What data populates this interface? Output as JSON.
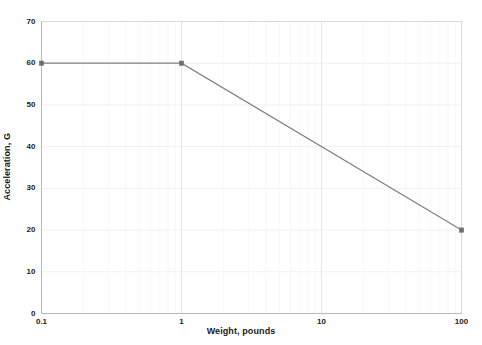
{
  "chart_data": {
    "type": "line",
    "title": "",
    "subtitle": "",
    "xlabel": "Weight, pounds",
    "ylabel": "Acceleration, G",
    "xscale": "log",
    "yscale": "linear",
    "xlim": [
      0.1,
      100
    ],
    "ylim": [
      0,
      70
    ],
    "grid": true,
    "legend": null,
    "xticks": [
      "0.1",
      "1",
      "10",
      "100"
    ],
    "xtick_values": [
      0.1,
      1,
      10,
      100
    ],
    "yticks": [
      "0",
      "10",
      "20",
      "30",
      "40",
      "50",
      "60",
      "70"
    ],
    "ytick_values": [
      0,
      10,
      20,
      30,
      40,
      50,
      60,
      70
    ],
    "series": [
      {
        "name": "Acceleration vs Weight",
        "color": "#808080",
        "marker": "square",
        "marker_color": "#707070",
        "x": [
          0.1,
          1,
          100
        ],
        "y": [
          60,
          60,
          20
        ]
      }
    ],
    "annotations": []
  },
  "axes": {
    "frame_color": "#d9d9d9",
    "gridline_color": "#f0f0f0",
    "tick_color": "#1c1c1c",
    "background": "#ffffff"
  }
}
